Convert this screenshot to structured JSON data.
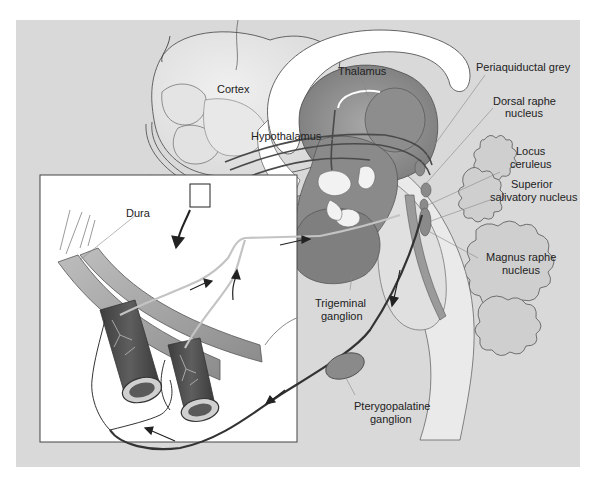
{
  "figure": {
    "colors": {
      "background": "#ffffff",
      "panel": "#d9d9d9",
      "inset_bg": "#ffffff",
      "brain_light": "#e6e6e6",
      "tissue_mid": "#9a9a9a",
      "tissue_dark": "#6e6e6e",
      "vessel_dark": "#4d4d4d",
      "nerve_light": "#c8c8c8",
      "pathway_dark": "#333333",
      "label_text": "#222222"
    },
    "labels": {
      "cortex": "Cortex",
      "thalamus": "Thalamus",
      "hypothalamus": "Hypothalamus",
      "periaqueductal_grey": "Periaquiductal grey",
      "dorsal_raphe_1": "Dorsal raphe",
      "dorsal_raphe_2": "nucleus",
      "locus_ceruleus_1": "Locus",
      "locus_ceruleus_2": "ceruleus",
      "superior_salivatory_1": "Superior",
      "superior_salivatory_2": "salivatory nucleus",
      "magnus_raphe_1": "Magnus raphe",
      "magnus_raphe_2": "nucleus",
      "trigeminal_ganglion_1": "Trigeminal",
      "trigeminal_ganglion_2": "ganglion",
      "pterygopalatine_ganglion_1": "Pterygopalatine",
      "pterygopalatine_ganglion_2": "ganglion",
      "dura": "Dura"
    }
  }
}
